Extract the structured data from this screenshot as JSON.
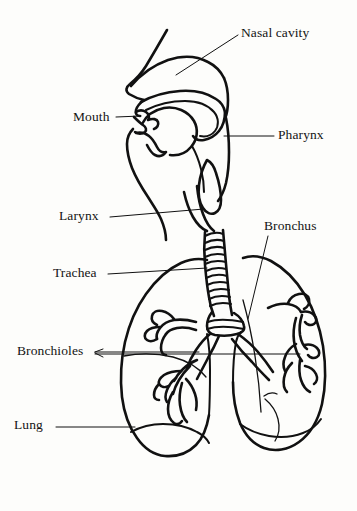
{
  "diagram": {
    "style": "hand-drawn line illustration",
    "ink_color": "#111111",
    "background_color": "#fdfdfb",
    "labels": [
      {
        "id": "nasal-cavity",
        "text": "Nasal cavity",
        "x": 241,
        "y": 26,
        "align": "left"
      },
      {
        "id": "mouth",
        "text": "Mouth",
        "x": 73,
        "y": 110,
        "align": "left"
      },
      {
        "id": "pharynx",
        "text": "Pharynx",
        "x": 278,
        "y": 128,
        "align": "left"
      },
      {
        "id": "larynx",
        "text": "Larynx",
        "x": 59,
        "y": 209,
        "align": "left"
      },
      {
        "id": "bronchus",
        "text": "Bronchus",
        "x": 264,
        "y": 219,
        "align": "left"
      },
      {
        "id": "trachea",
        "text": "Trachea",
        "x": 53,
        "y": 266,
        "align": "left"
      },
      {
        "id": "bronchioles",
        "text": "Bronchioles",
        "x": 17,
        "y": 344,
        "align": "left"
      },
      {
        "id": "lung",
        "text": "Lung",
        "x": 14,
        "y": 418,
        "align": "left"
      }
    ],
    "parts": [
      "nasal cavity",
      "mouth",
      "pharynx",
      "larynx",
      "trachea",
      "bronchus",
      "bronchioles",
      "lung"
    ]
  }
}
